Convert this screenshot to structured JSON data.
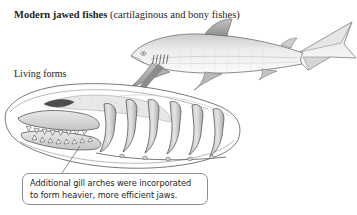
{
  "figure": {
    "width": 357,
    "height": 215,
    "background": "#ffffff",
    "type": "scientific-illustration"
  },
  "title": {
    "bold_text": "Modern jawed fishes",
    "paren_text": " (cartilaginous and bony fishes)",
    "color": "#231f1c"
  },
  "living_forms": {
    "label": "Living forms",
    "color": "#231f1c"
  },
  "callout": {
    "line1": "Additional gill arches were incorporated",
    "line2": "to form heavier, more efficient jaws.",
    "border_color": "#8e8e8e",
    "text_color": "#1d1d1b",
    "background": "#ffffff"
  },
  "illustrations": {
    "shark": {
      "name": "shark-illustration",
      "description": "grayscale pencil drawing of a shark facing right with dorsal fin, pectoral fins, pelvic fin, anal fin and heterocercal tail",
      "line_color": "#6f6f6f",
      "fill_light": "#f2f2f2",
      "fill_mid": "#d8d8d8",
      "fill_dark": "#b4b4b4"
    },
    "skull": {
      "name": "shark-skull-illustration",
      "description": "cutaway drawing of shark head showing upper and lower jaws with teeth and a series of gill arches behind the jaw",
      "line_color": "#4a4a4a",
      "fill_light": "#ededed",
      "fill_mid": "#cfcfcf",
      "fill_dark": "#a8a8a8"
    },
    "arrow": {
      "name": "transformation-arrow",
      "description": "thick curved gray arrow pointing down-left from the shark gill region into the gill arches of the skull",
      "color": "#8c8c8c"
    },
    "leader_line": {
      "name": "callout-leader-line",
      "description": "thin diagonal line connecting the callout box to the lower jaw",
      "color": "#6f6f6f"
    }
  }
}
